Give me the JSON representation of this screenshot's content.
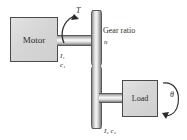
{
  "figure": {
    "background_color": "#ffffff",
    "line_color": "#4a4a4a",
    "body_fill": "#d6d6d6"
  },
  "blocks": {
    "motor": {
      "label": "Motor",
      "name": "motor-block"
    },
    "load": {
      "label": "Load",
      "name": "load-block"
    }
  },
  "gears": {
    "ratio_text": "Gear ratio",
    "ratio_symbol": "n",
    "upper_name": "gear-disc-upper",
    "lower_name": "gear-disc-lower"
  },
  "shafts": {
    "motor_side": {
      "inertia": "I₁",
      "damping": "c₁"
    },
    "load_side": {
      "inertia_damping": "I₂ c₂"
    }
  },
  "annotations": {
    "torque": "T",
    "angle": "θ"
  }
}
